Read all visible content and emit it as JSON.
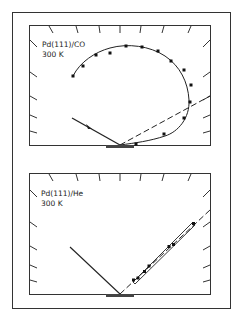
{
  "figure": {
    "type": "scattering-diagram",
    "panels": [
      {
        "id": "top",
        "label_line1": "Pd(111)/CO",
        "label_line2": "300 K",
        "description": "Polar plot of scattered intensity: incident beam with arrow, specular dashed line, lobe of data points with fitted curve"
      },
      {
        "id": "bottom",
        "label_line1": "Pd(111)/He",
        "label_line2": "300 K",
        "description": "Incident beam and narrow specular lobe with data points along the dashed specular direction"
      }
    ]
  },
  "colors": {
    "ink": "#222222",
    "background": "#ffffff"
  }
}
